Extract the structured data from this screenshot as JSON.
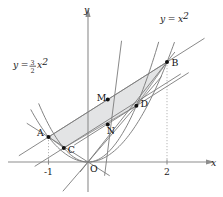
{
  "figure": {
    "background_color": "#ffffff",
    "curve_color": "#7c7c7c",
    "axis_color": "#8d8d8d",
    "shade_color": "#d8dadb",
    "point_color": "#111111"
  },
  "axes": {
    "x_label": "x",
    "y_label": "y",
    "x_ticks": [
      {
        "label": "-1",
        "value": -1
      },
      {
        "label": "2",
        "value": 2
      }
    ],
    "origin_label": "O",
    "x_range": [
      -1.9,
      3.1
    ],
    "y_range": [
      -0.55,
      5.1
    ]
  },
  "equations": [
    {
      "id": "parabola-outer",
      "display": "y = 3/2 x^2",
      "lhs": "y",
      "eq": "=",
      "coef_num": "3",
      "coef_den": "2",
      "var": "x",
      "exponent": "2"
    },
    {
      "id": "parabola-unit",
      "display": "y = x^2",
      "lhs": "y",
      "eq": "=",
      "var": "x",
      "exponent": "2"
    }
  ],
  "points": [
    {
      "name": "A",
      "label": "A",
      "x": -1,
      "y": 1,
      "label_side": "left"
    },
    {
      "name": "B",
      "label": "B",
      "x": 2,
      "y": 4,
      "label_side": "right"
    },
    {
      "name": "C",
      "label": "C",
      "x": -0.6124,
      "y": 0.5625,
      "label_side": "right"
    },
    {
      "name": "D",
      "label": "D",
      "x": 1.2247,
      "y": 2.25,
      "label_side": "right"
    },
    {
      "name": "M",
      "label": "M",
      "x": 0.5,
      "y": 2.5,
      "label_side": "left"
    },
    {
      "name": "N",
      "label": "N",
      "x": 0.5,
      "y": 1.5,
      "label_side": "below"
    },
    {
      "name": "O",
      "label": "O",
      "x": 0,
      "y": 0,
      "label_side": "below-right"
    }
  ],
  "chart_data": {
    "type": "line",
    "xlabel": "x",
    "ylabel": "y",
    "xlim": [
      -1.9,
      3.1
    ],
    "ylim": [
      -0.55,
      5.1
    ],
    "grid": false,
    "legend": "inline-equation-labels",
    "series": [
      {
        "name": "y = x^2",
        "type": "parabola",
        "a": 1,
        "formula": "y = x*x",
        "x": [
          -1.45,
          -1.2,
          -1.0,
          -0.75,
          -0.5,
          -0.25,
          0,
          0.25,
          0.5,
          0.75,
          1.0,
          1.25,
          1.5,
          1.75,
          2.0,
          2.2
        ],
        "values": [
          2.1,
          1.44,
          1.0,
          0.5625,
          0.25,
          0.0625,
          0,
          0.0625,
          0.25,
          0.5625,
          1.0,
          1.5625,
          2.25,
          3.0625,
          4.0,
          4.84
        ]
      },
      {
        "name": "y = 3/2 x^2",
        "type": "parabola",
        "a": 1.5,
        "formula": "y = 1.5*x*x",
        "x": [
          -1.25,
          -1.0,
          -0.75,
          -0.5,
          -0.25,
          0,
          0.25,
          0.5,
          0.75,
          1.0,
          1.25,
          1.5,
          1.8
        ],
        "values": [
          2.34,
          1.5,
          0.84,
          0.375,
          0.094,
          0,
          0.094,
          0.375,
          0.84,
          1.5,
          2.34,
          3.375,
          4.86
        ]
      },
      {
        "name": "chord AB",
        "type": "line",
        "slope": 1,
        "intercept": 2,
        "from": [
          -1,
          1
        ],
        "to": [
          2,
          4
        ]
      },
      {
        "name": "tangent to y = x^2 at C",
        "type": "line",
        "through": [
          -0.6124,
          0.5625
        ],
        "slope": 1
      },
      {
        "name": "tangent to y = 3/2 x^2 at D",
        "type": "line",
        "through": [
          1.2247,
          2.25
        ],
        "slope": 1
      },
      {
        "name": "secant O to B",
        "type": "line",
        "from": [
          0,
          0
        ],
        "to": [
          2,
          4
        ]
      },
      {
        "name": "secant O to D",
        "type": "line",
        "from": [
          0,
          0
        ],
        "to": [
          1.2247,
          2.25
        ]
      },
      {
        "name": "secant O to M-region",
        "type": "line",
        "from": [
          0,
          0
        ],
        "to": [
          0.85,
          4.6
        ]
      },
      {
        "name": "line through A and O extended",
        "type": "line",
        "from": [
          -1,
          1
        ],
        "to": [
          0.5,
          -0.6
        ]
      }
    ],
    "shaded_region": {
      "name": "parallelogram A-M-B-N-C region",
      "vertices": [
        [
          -1,
          1
        ],
        [
          0.5,
          2.5
        ],
        [
          2,
          4
        ],
        [
          1.2247,
          2.25
        ],
        [
          -0.6124,
          0.5625
        ]
      ],
      "color": "#d8dadb"
    },
    "annotations": [
      {
        "text": "y = 3/2 x^2",
        "x": -1.55,
        "y": 3.3
      },
      {
        "text": "y = x^2",
        "x": 2.1,
        "y": 4.95
      },
      {
        "text": "A",
        "x": -1.15,
        "y": 1.25
      },
      {
        "text": "B",
        "x": 2.12,
        "y": 4.0
      },
      {
        "text": "C",
        "x": -0.45,
        "y": 0.48
      },
      {
        "text": "D",
        "x": 1.33,
        "y": 2.35
      },
      {
        "text": "M",
        "x": 0.32,
        "y": 2.68
      },
      {
        "text": "N",
        "x": 0.5,
        "y": 1.2
      },
      {
        "text": "O",
        "x": 0.08,
        "y": -0.2
      },
      {
        "text": "-1",
        "x": -1,
        "y": -0.35
      },
      {
        "text": "2",
        "x": 2,
        "y": -0.35
      }
    ]
  }
}
